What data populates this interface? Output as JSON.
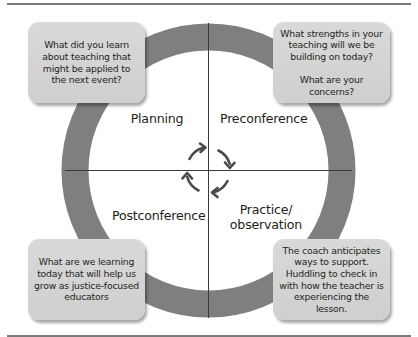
{
  "diagram": {
    "type": "cycle",
    "center_symbol": "clockwise-cycle-arrows",
    "colors": {
      "ring": "#7f7f7f",
      "box_fill": "#d4d4d4",
      "axis_line": "#3a3a3a",
      "rule": "#7a7a7a",
      "text": "#231f20"
    },
    "quadrants": {
      "top_left": {
        "label": "Planning"
      },
      "top_right": {
        "label": "Preconference"
      },
      "bottom_left": {
        "label": "Postconference"
      },
      "bottom_right": {
        "label": "Practice/\nobservation"
      }
    },
    "callouts": {
      "top_left": "What did you learn\nabout teaching that\nmight be applied to\nthe next event?",
      "top_right": "What strengths in your\nteaching will we be\nbuilding on today?\n\nWhat are your concerns?",
      "bottom_left": "What are we learning\ntoday that will help us\ngrow as justice-focused\neducators",
      "bottom_right": "The coach anticipates\nways to support.\nHuddling to check in\nwith how the teacher is\nexperiencing the lesson."
    }
  }
}
